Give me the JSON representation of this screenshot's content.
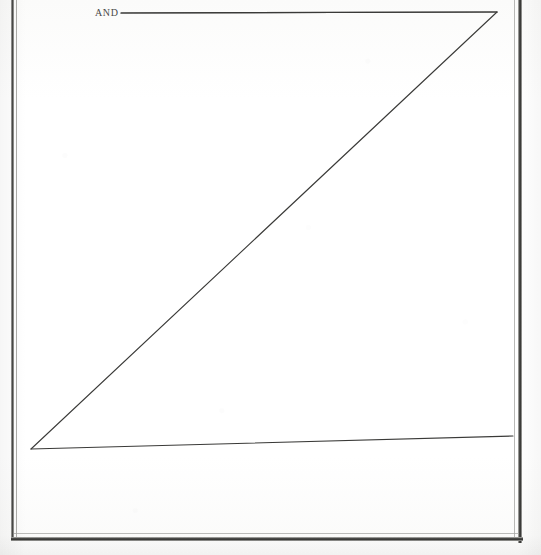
{
  "page": {
    "width": 541,
    "height": 555,
    "background_color": "#fdfdfc",
    "ink_color": "#3a3a38",
    "border_color": "#43433f"
  },
  "labels": {
    "and": "AND"
  },
  "chart_data": {
    "type": "line",
    "title": "AND",
    "xlabel": "",
    "ylabel": "",
    "xlim": [
      0,
      541
    ],
    "ylim": [
      555,
      0
    ],
    "grid": false,
    "legend": "none",
    "annotations": [
      {
        "text": "AND",
        "x": 96,
        "y": 14,
        "leader_line": {
          "x1": 121,
          "y1": 13,
          "x2": 497,
          "y2": 12
        }
      }
    ],
    "series": [
      {
        "name": "top-horizontal-trace",
        "points": [
          [
            121,
            13
          ],
          [
            497,
            12
          ]
        ]
      },
      {
        "name": "descending-diagonal-trace",
        "points": [
          [
            497,
            12
          ],
          [
            31,
            449
          ]
        ]
      },
      {
        "name": "lower-near-horizontal-trace",
        "points": [
          [
            31,
            449
          ],
          [
            513,
            436
          ]
        ]
      }
    ],
    "frame": {
      "left_rule_x": 12,
      "right_rule_x": 520,
      "bottom_rule_y": 539,
      "top_rule_visible": false
    }
  }
}
